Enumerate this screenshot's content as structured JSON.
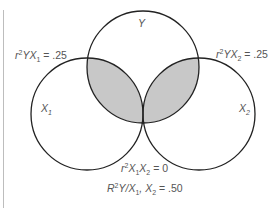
{
  "diagram": {
    "type": "venn",
    "circles": [
      {
        "id": "Y",
        "label": "Y",
        "cx": 143,
        "cy": 67,
        "r": 56
      },
      {
        "id": "X1",
        "label": "X",
        "label_sub": "1",
        "cx": 87,
        "cy": 114,
        "r": 56
      },
      {
        "id": "X2",
        "label": "X",
        "label_sub": "2",
        "cx": 199,
        "cy": 114,
        "r": 56
      }
    ],
    "shaded_regions": [
      "Y∩X1",
      "Y∩X2"
    ],
    "colors": {
      "stroke": "#222222",
      "shade": "#c8c8c8",
      "text": "#555555"
    },
    "annotations": {
      "r2_yx1": {
        "pre": "r",
        "sup": "2",
        "mid": "YX",
        "sub": "1",
        "post": " = .25"
      },
      "r2_yx2": {
        "pre": "r",
        "sup": "2",
        "mid": "YX",
        "sub": "2",
        "post": " = .25"
      },
      "r2_x1x2": {
        "pre": "r",
        "sup": "2",
        "a": "X",
        "a_sub": "1",
        "b": "X",
        "b_sub": "2",
        "post": " = 0"
      },
      "R2_y_x1x2": {
        "pre": "R",
        "sup": "2",
        "mid": "Y/X",
        "sub1": "1",
        "comma": ", X",
        "sub2": "2",
        "post": " = .50"
      }
    }
  }
}
